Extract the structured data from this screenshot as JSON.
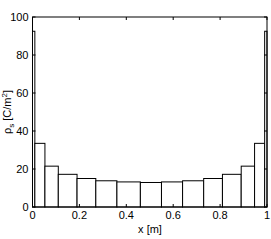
{
  "chart_data": {
    "type": "bar",
    "title": "",
    "xlabel": "x [m]",
    "ylabel": "ρs [C/m²]",
    "xlim": [
      0,
      1
    ],
    "ylim": [
      0,
      100
    ],
    "xticks": [
      "0",
      "0.2",
      "0.4",
      "0.6",
      "0.8",
      "1"
    ],
    "yticks": [
      "0",
      "20",
      "40",
      "60",
      "80",
      "100"
    ],
    "grid": false,
    "legend": null,
    "bin_edges": [
      0,
      0.01,
      0.053,
      0.11,
      0.19,
      0.27,
      0.36,
      0.46,
      0.55,
      0.64,
      0.73,
      0.81,
      0.89,
      0.947,
      0.99,
      1
    ],
    "values": [
      92.5,
      33.5,
      21.5,
      17.2,
      15.0,
      13.8,
      13.2,
      12.9,
      13.2,
      13.8,
      15.0,
      17.2,
      21.5,
      33.5,
      92.5
    ]
  },
  "labels": {
    "x": "x [m]",
    "y_main": "ρ",
    "y_sub": "s",
    "y_unit": " [C/m",
    "y_sup": "2",
    "y_close": "]"
  }
}
